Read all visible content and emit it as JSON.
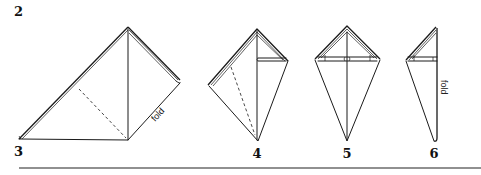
{
  "diagram": {
    "type": "origami-folding-steps",
    "steps": [
      {
        "number": "2",
        "pos": [
          18,
          16
        ]
      },
      {
        "number": "3",
        "pos": [
          18,
          156
        ],
        "annotation": "fold"
      },
      {
        "number": "4",
        "pos": [
          257,
          158
        ]
      },
      {
        "number": "5",
        "pos": [
          347,
          158
        ]
      },
      {
        "number": "6",
        "pos": [
          434,
          158
        ],
        "annotation": "fold"
      }
    ],
    "labels": {
      "step2": "2",
      "step3": "3",
      "step4": "4",
      "step5": "5",
      "step6": "6",
      "fold3": "fold",
      "fold6": "fold"
    },
    "colors": {
      "line": "#1a1a1a",
      "background": "#ffffff"
    }
  }
}
